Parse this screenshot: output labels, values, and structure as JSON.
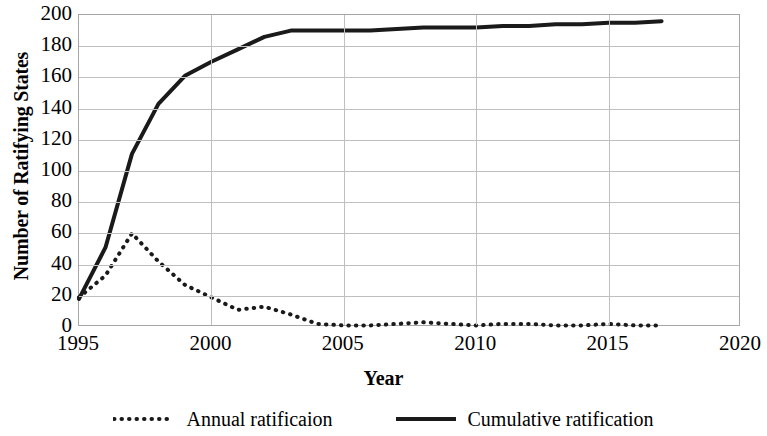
{
  "chart_data": {
    "type": "line",
    "title": "",
    "xlabel": "Year",
    "ylabel": "Number of Ratifying States",
    "xlim": [
      1995,
      2020
    ],
    "ylim": [
      0,
      200
    ],
    "xticks": [
      1995,
      2000,
      2005,
      2010,
      2015,
      2020
    ],
    "yticks": [
      0,
      20,
      40,
      60,
      80,
      100,
      120,
      140,
      160,
      180,
      200
    ],
    "grid": "horizontal-and-vertical",
    "legend_position": "bottom-center",
    "x": [
      1995,
      1996,
      1997,
      1998,
      1999,
      2000,
      2001,
      2002,
      2003,
      2004,
      2005,
      2006,
      2007,
      2008,
      2009,
      2010,
      2011,
      2012,
      2013,
      2014,
      2015,
      2016,
      2017
    ],
    "series": [
      {
        "name": "Annual ratificaion",
        "style": "dotted",
        "color": "#1a1a1a",
        "values": [
          19,
          33,
          60,
          42,
          27,
          19,
          11,
          13,
          8,
          2,
          1,
          1,
          2,
          3,
          2,
          1,
          2,
          2,
          1,
          1,
          2,
          1,
          1
        ]
      },
      {
        "name": "Cumulative ratification",
        "style": "solid",
        "color": "#1a1a1a",
        "values": [
          18,
          51,
          111,
          143,
          161,
          170,
          178,
          186,
          190,
          190,
          190,
          190,
          191,
          192,
          192,
          192,
          193,
          193,
          194,
          194,
          195,
          195,
          196
        ]
      }
    ]
  },
  "axes": {
    "y_title": "Number of Ratifying States",
    "x_title": "Year",
    "y_tick_labels": [
      "200",
      "180",
      "160",
      "140",
      "120",
      "100",
      "80",
      "60",
      "40",
      "20",
      "0"
    ],
    "x_tick_labels": [
      "1995",
      "2000",
      "2005",
      "2010",
      "2015",
      "2020"
    ]
  },
  "legend": {
    "entries": [
      {
        "label": "Annual ratificaion",
        "style": "dotted"
      },
      {
        "label": "Cumulative ratification",
        "style": "solid"
      }
    ]
  },
  "colors": {
    "line": "#1a1a1a",
    "gridline": "#bfbfbf",
    "frame": "#a6a6a6",
    "background": "#ffffff",
    "text": "#000000"
  }
}
